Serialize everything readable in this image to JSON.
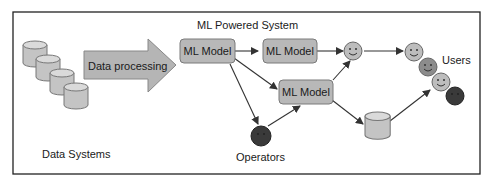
{
  "diagram": {
    "title": "ML Powered System",
    "data_systems_label": "Data Systems",
    "process_arrow_label": "Data processing",
    "models": [
      {
        "id": "model-1",
        "label": "ML Model"
      },
      {
        "id": "model-2",
        "label": "ML Model"
      },
      {
        "id": "model-3",
        "label": "ML Model"
      }
    ],
    "operators_label": "Operators",
    "users_label": "Users",
    "colors": {
      "frame": "#222222",
      "box_fill": "#b8b8b8",
      "box_stroke": "#7a7a7a",
      "cylinder_fill": "#c4c4c4",
      "face_light": "#bdbdbd",
      "face_mid": "#8c8c8c",
      "face_dark": "#3a3a3a",
      "arrow": "#333333"
    },
    "edges": [
      {
        "from": "model-1",
        "to": "model-2"
      },
      {
        "from": "model-1",
        "to": "model-3"
      },
      {
        "from": "model-1",
        "to": "operator"
      },
      {
        "from": "operator",
        "to": "model-3"
      },
      {
        "from": "model-2",
        "to": "face-mid"
      },
      {
        "from": "model-3",
        "to": "face-mid"
      },
      {
        "from": "model-3",
        "to": "storage"
      },
      {
        "from": "face-mid",
        "to": "users"
      },
      {
        "from": "storage",
        "to": "users"
      }
    ]
  }
}
